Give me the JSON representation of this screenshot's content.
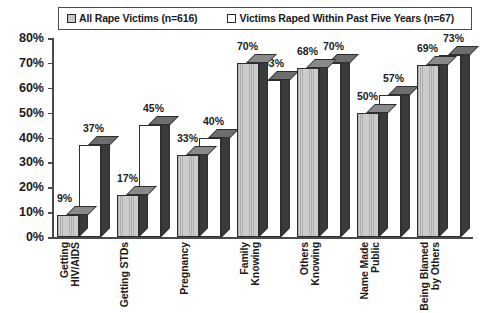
{
  "chart_data": {
    "type": "bar",
    "title": "",
    "xlabel": "",
    "ylabel": "",
    "ylim": [
      0,
      80
    ],
    "ytick_labels": [
      "80%",
      "70%",
      "60%",
      "50%",
      "40%",
      "30%",
      "20%",
      "10%",
      "0%"
    ],
    "ytick_values": [
      80,
      70,
      60,
      50,
      40,
      30,
      20,
      10,
      0
    ],
    "grid": false,
    "legend_position": "top",
    "categories": [
      "Getting HIV/AIDS",
      "Getting STDs",
      "Pregnancy",
      "Family Knowing",
      "Others Knowing",
      "Name Made Public",
      "Being Blamed by Others"
    ],
    "category_lines": [
      [
        "Getting",
        "HIV/AIDS"
      ],
      [
        "Getting STDs"
      ],
      [
        "Pregnancy"
      ],
      [
        "Family",
        "Knowing"
      ],
      [
        "Others",
        "Knowing"
      ],
      [
        "Name Made",
        "Public"
      ],
      [
        "Being Blamed",
        "by Others"
      ]
    ],
    "series": [
      {
        "name": "All Rape Victims (n=616)",
        "swatch": "gray",
        "values": [
          9,
          17,
          33,
          70,
          68,
          50,
          69
        ],
        "labels": [
          "9%",
          "17%",
          "33%",
          "70%",
          "68%",
          "50%",
          "69%"
        ]
      },
      {
        "name": "Victims Raped Within Past Five Years (n=67)",
        "swatch": "white",
        "values": [
          37,
          45,
          40,
          63,
          70,
          57,
          73
        ],
        "labels": [
          "37%",
          "45%",
          "40%",
          "63%",
          "70%",
          "57%",
          "73%"
        ]
      }
    ],
    "colors": {
      "series1_fill": "#cccccc",
      "series2_fill": "#ffffff",
      "bar_outline": "#2e2e2e",
      "depth_side": "#3a3a3a",
      "depth_top": "#6e6e6e",
      "axis": "#4a4a4a",
      "text": "#1a1a1a",
      "background": "#ffffff"
    }
  },
  "legend": {
    "entries": [
      {
        "label": "All Rape Victims (n=616)",
        "swatch": "gray"
      },
      {
        "label": "Victims Raped Within Past Five Years (n=67)",
        "swatch": "white"
      }
    ]
  }
}
